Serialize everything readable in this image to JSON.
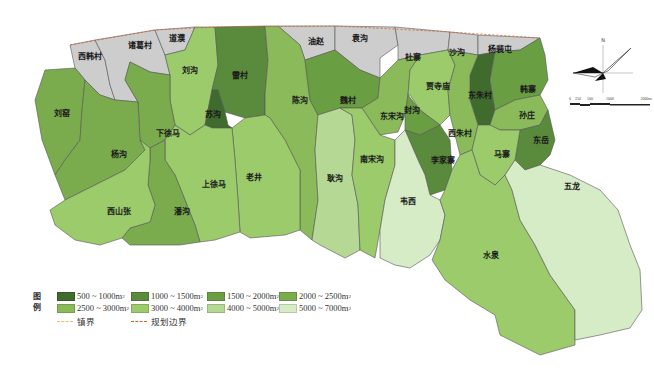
{
  "legend": {
    "title": "图例",
    "classes": [
      {
        "label": "500 ~ 1000m",
        "sup": "2",
        "color": "#3f6b2c"
      },
      {
        "label": "1000 ~ 1500m",
        "sup": "2",
        "color": "#5a8a3c"
      },
      {
        "label": "1500 ~ 2000m",
        "sup": "2",
        "color": "#6a9e42"
      },
      {
        "label": "2000 ~ 2500m",
        "sup": "2",
        "color": "#7aac4e"
      },
      {
        "label": "2500 ~ 3000m",
        "sup": "2",
        "color": "#8aba5a"
      },
      {
        "label": "3000 ~ 4000m",
        "sup": "2",
        "color": "#9ccb6c"
      },
      {
        "label": "4000 ~ 5000m",
        "sup": "2",
        "color": "#b5d994"
      },
      {
        "label": "5000 ~ 7000m",
        "sup": "2",
        "color": "#d6ecc6"
      }
    ],
    "lines": [
      {
        "label": "镇界",
        "color": "#e0c070"
      },
      {
        "label": "规划边界",
        "color": "#e0602a"
      }
    ]
  },
  "no_data_color": "#cdcdcd",
  "compass": {
    "north_label": "N"
  },
  "scale_bar": {
    "ticks": [
      "0",
      "250",
      "500",
      "1000",
      "2000m"
    ]
  },
  "regions": [
    {
      "name": "西韩村",
      "class": null
    },
    {
      "name": "诸葛村",
      "class": null
    },
    {
      "name": "道濮",
      "class": null
    },
    {
      "name": "油赵",
      "class": null
    },
    {
      "name": "袁沟",
      "class": null
    },
    {
      "name": "杜寨",
      "class": null
    },
    {
      "name": "沙沟",
      "class": null
    },
    {
      "name": "杨裴屯",
      "class": null
    },
    {
      "name": "刘沟",
      "class": "3000 ~ 4000m2"
    },
    {
      "name": "雷村",
      "class": "1000 ~ 1500m2"
    },
    {
      "name": "苏沟",
      "class": "500 ~ 1000m2"
    },
    {
      "name": "刘窑",
      "class": "2000 ~ 2500m2"
    },
    {
      "name": "下徐马",
      "class": "2000 ~ 2500m2"
    },
    {
      "name": "杨沟",
      "class": "2000 ~ 2500m2"
    },
    {
      "name": "陈沟",
      "class": "2500 ~ 3000m2"
    },
    {
      "name": "魏村",
      "class": "1500 ~ 2000m2"
    },
    {
      "name": "贾寺庙",
      "class": "3000 ~ 4000m2"
    },
    {
      "name": "东朱村",
      "class": "500 ~ 1000m2"
    },
    {
      "name": "韩寨",
      "class": "1500 ~ 2000m2"
    },
    {
      "name": "孙庄",
      "class": "2500 ~ 3000m2"
    },
    {
      "name": "东宋沟",
      "class": "2500 ~ 3000m2"
    },
    {
      "name": "封沟",
      "class": "1500 ~ 2000m2"
    },
    {
      "name": "西朱村",
      "class": "2500 ~ 3000m2"
    },
    {
      "name": "东岳",
      "class": "1000 ~ 1500m2"
    },
    {
      "name": "李家寨",
      "class": "1000 ~ 1500m2"
    },
    {
      "name": "马寨",
      "class": "3000 ~ 4000m2"
    },
    {
      "name": "耿沟",
      "class": "4000 ~ 5000m2"
    },
    {
      "name": "南宋沟",
      "class": "3000 ~ 4000m2"
    },
    {
      "name": "老井",
      "class": "3000 ~ 4000m2"
    },
    {
      "name": "上徐马",
      "class": "3000 ~ 4000m2"
    },
    {
      "name": "潘沟",
      "class": "2000 ~ 2500m2"
    },
    {
      "name": "西山张",
      "class": "3000 ~ 4000m2"
    },
    {
      "name": "韦西",
      "class": "5000 ~ 7000m2"
    },
    {
      "name": "水泉",
      "class": "3000 ~ 4000m2"
    },
    {
      "name": "五龙",
      "class": "5000 ~ 7000m2"
    }
  ]
}
